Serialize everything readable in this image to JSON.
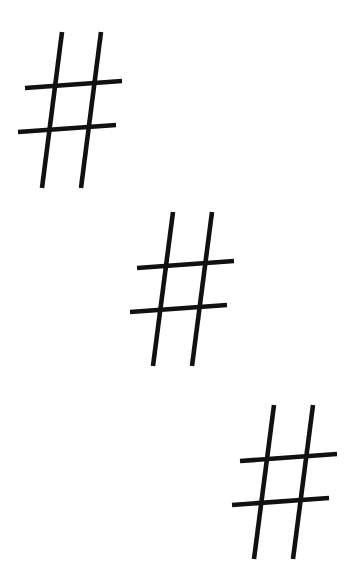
{
  "document": {
    "title": "Hash Symbols",
    "type": "line-drawing",
    "width": 355,
    "height": 567,
    "background_color": "#ffffff",
    "ink_color": "#111111",
    "description": "Three hand-drawn hash (number sign) glyphs arranged along a diagonal from upper-left to lower-right on a plain white field."
  },
  "style": {
    "stroke_color": "#111111",
    "stroke_width": 4.6,
    "stroke_linecap": "butt",
    "glyph_count": 3
  },
  "glyphs": [
    {
      "name": "hash-glyph-1",
      "label": "#",
      "position": "upper-left",
      "bbox": {
        "x": 18,
        "y": 31,
        "width": 105,
        "height": 158
      },
      "strokes": [
        {
          "name": "vertical-stroke-left",
          "x1": 62,
          "y1": 32,
          "x2": 42,
          "y2": 188
        },
        {
          "name": "vertical-stroke-right",
          "x1": 101,
          "y1": 32,
          "x2": 81,
          "y2": 188
        },
        {
          "name": "horizontal-bar-upper",
          "x1": 25,
          "y1": 88,
          "x2": 122,
          "y2": 81
        },
        {
          "name": "horizontal-bar-lower",
          "x1": 18,
          "y1": 132,
          "x2": 116,
          "y2": 125
        }
      ]
    },
    {
      "name": "hash-glyph-2",
      "label": "#",
      "position": "center",
      "bbox": {
        "x": 130,
        "y": 211,
        "width": 105,
        "height": 157
      },
      "strokes": [
        {
          "name": "vertical-stroke-left",
          "x1": 173,
          "y1": 212,
          "x2": 153,
          "y2": 366
        },
        {
          "name": "vertical-stroke-right",
          "x1": 212,
          "y1": 212,
          "x2": 192,
          "y2": 366
        },
        {
          "name": "horizontal-bar-upper",
          "x1": 137,
          "y1": 268,
          "x2": 234,
          "y2": 261
        },
        {
          "name": "horizontal-bar-lower",
          "x1": 130,
          "y1": 312,
          "x2": 227,
          "y2": 305
        }
      ]
    },
    {
      "name": "hash-glyph-3",
      "label": "#",
      "position": "lower-right",
      "bbox": {
        "x": 232,
        "y": 404,
        "width": 106,
        "height": 155
      },
      "strokes": [
        {
          "name": "vertical-stroke-left",
          "x1": 274,
          "y1": 405,
          "x2": 254,
          "y2": 559
        },
        {
          "name": "vertical-stroke-right",
          "x1": 313,
          "y1": 405,
          "x2": 293,
          "y2": 559
        },
        {
          "name": "horizontal-bar-upper",
          "x1": 240,
          "y1": 461,
          "x2": 337,
          "y2": 454
        },
        {
          "name": "horizontal-bar-lower",
          "x1": 232,
          "y1": 505,
          "x2": 329,
          "y2": 498
        }
      ]
    }
  ]
}
